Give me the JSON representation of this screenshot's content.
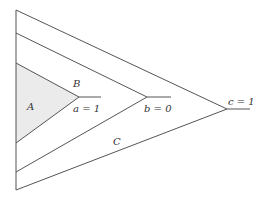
{
  "diagram": {
    "regions": [
      {
        "id": "A",
        "label": "A",
        "shaded": true,
        "fill": "#ebebeb"
      },
      {
        "id": "B",
        "label": "B"
      },
      {
        "id": "C",
        "label": "C"
      }
    ],
    "nodes": [
      {
        "id": "a",
        "label": "a = 1"
      },
      {
        "id": "b",
        "label": "b = 0"
      },
      {
        "id": "c",
        "label": "c = 1"
      }
    ],
    "line_color": "#555555"
  }
}
